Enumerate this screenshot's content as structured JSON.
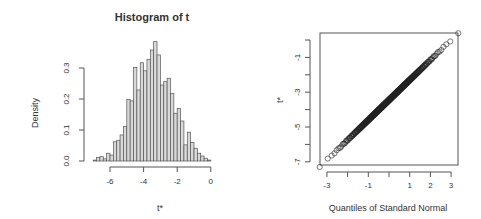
{
  "chart_data": [
    {
      "type": "bar",
      "title": "Histogram of t",
      "xlabel": "t*",
      "ylabel": "Density",
      "xlim": [
        -7,
        0
      ],
      "ylim": [
        0,
        0.39
      ],
      "xticks": [
        -6,
        -4,
        -2,
        0
      ],
      "yticks": [
        "0.0",
        "0.1",
        "0.2",
        "0.3"
      ],
      "bin_start": -7.0,
      "bin_width": 0.2,
      "values": [
        0.003,
        0.011,
        0.014,
        0.007,
        0.025,
        0.019,
        0.062,
        0.067,
        0.084,
        0.111,
        0.199,
        0.194,
        0.302,
        0.229,
        0.317,
        0.291,
        0.328,
        0.358,
        0.385,
        0.342,
        0.245,
        0.256,
        0.267,
        0.218,
        0.154,
        0.17,
        0.129,
        0.052,
        0.093,
        0.06,
        0.041,
        0.025,
        0.016,
        0.009,
        0.003
      ],
      "grid": false
    },
    {
      "type": "scatter",
      "title": "",
      "xlabel": "Quantiles of Standard Normal",
      "ylabel": "t*",
      "xlim": [
        -3.3,
        3.3
      ],
      "ylim": [
        -7.2,
        0.2
      ],
      "xticks": [
        -3,
        -2,
        -1,
        0,
        1,
        2,
        3
      ],
      "xtick_labels": [
        "-3",
        "",
        "-1",
        "",
        "1",
        "2",
        "3"
      ],
      "yticks": [
        0,
        -1,
        -2,
        -3,
        -4,
        -5,
        -6,
        -7
      ],
      "ytick_labels": [
        "",
        "-1",
        "",
        "-3",
        "",
        "-5",
        "",
        "-7"
      ],
      "line": {
        "intercept": -3.45,
        "slope": 1.15
      },
      "x_range": [
        -3.1,
        3.1
      ],
      "grid": false
    }
  ]
}
